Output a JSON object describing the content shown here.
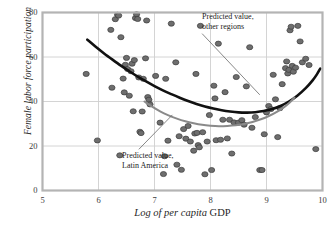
{
  "chart_data": {
    "type": "scatter",
    "title": "",
    "xlabel": "Log of per capita GDP",
    "xlabel_italic_part": "Log of per capita",
    "xlabel_roman_part": "GDP",
    "ylabel": "Female labor force participation",
    "xlim": [
      5,
      10
    ],
    "ylim": [
      0,
      80
    ],
    "xticks": [
      5,
      6,
      7,
      8,
      9,
      10
    ],
    "yticks": [
      0,
      20,
      40,
      60,
      80
    ],
    "grid": true,
    "legend_position": "annotations-inline",
    "colors": {
      "point_fill": "#6e6e6e",
      "point_stroke": "#3c3c3c",
      "curve_other_regions": "#111111",
      "curve_latin_america": "#8a8a8a",
      "grid": "#cfcfcf",
      "frame": "#b4b4b4",
      "text": "#1f1f1f"
    },
    "annotations": [
      {
        "name": "predicted-other-regions",
        "lines": [
          "Predicted value,",
          "other regions"
        ],
        "text_x": 7.85,
        "text_y": 78,
        "leader_from": [
          7.85,
          70.5
        ],
        "leader_to": [
          8.88,
          43.0
        ]
      },
      {
        "name": "predicted-latin-america",
        "lines": [
          "Predicted value,",
          "Latin America"
        ],
        "text_x": 6.42,
        "text_y": 15.5,
        "leader_from": [
          6.72,
          18.5
        ],
        "leader_to": [
          7.32,
          34.0
        ]
      }
    ],
    "series": [
      {
        "name": "Predicted value, other regions",
        "type": "curve",
        "color": "#111111",
        "width": 2.6,
        "points": [
          [
            5.8,
            67.8
          ],
          [
            5.95,
            64.6
          ],
          [
            6.1,
            61.6
          ],
          [
            6.25,
            58.8
          ],
          [
            6.4,
            56.1
          ],
          [
            6.55,
            53.6
          ],
          [
            6.7,
            51.2
          ],
          [
            6.85,
            49.0
          ],
          [
            7.0,
            46.9
          ],
          [
            7.15,
            45.0
          ],
          [
            7.3,
            43.3
          ],
          [
            7.45,
            41.7
          ],
          [
            7.6,
            40.2
          ],
          [
            7.75,
            38.9
          ],
          [
            7.9,
            37.8
          ],
          [
            8.05,
            36.9
          ],
          [
            8.2,
            36.1
          ],
          [
            8.35,
            35.5
          ],
          [
            8.5,
            35.1
          ],
          [
            8.65,
            35.0
          ],
          [
            8.8,
            35.2
          ],
          [
            8.95,
            35.7
          ],
          [
            9.1,
            36.6
          ],
          [
            9.25,
            38.0
          ],
          [
            9.4,
            40.0
          ],
          [
            9.55,
            42.6
          ],
          [
            9.7,
            46.0
          ],
          [
            9.82,
            49.4
          ],
          [
            9.9,
            52.2
          ],
          [
            9.96,
            54.8
          ]
        ]
      },
      {
        "name": "Predicted value, Latin America",
        "type": "curve",
        "color": "#8a8a8a",
        "width": 2.0,
        "points": [
          [
            6.82,
            40.0
          ],
          [
            6.95,
            37.8
          ],
          [
            7.1,
            35.6
          ],
          [
            7.25,
            33.8
          ],
          [
            7.4,
            32.3
          ],
          [
            7.55,
            31.1
          ],
          [
            7.7,
            30.2
          ],
          [
            7.85,
            29.5
          ],
          [
            8.0,
            29.1
          ],
          [
            8.15,
            28.9
          ],
          [
            8.3,
            29.0
          ],
          [
            8.45,
            29.3
          ],
          [
            8.6,
            29.9
          ],
          [
            8.75,
            30.8
          ],
          [
            8.9,
            32.0
          ],
          [
            9.05,
            33.6
          ],
          [
            9.2,
            35.6
          ],
          [
            9.32,
            37.6
          ],
          [
            9.42,
            39.7
          ],
          [
            9.5,
            41.8
          ]
        ]
      },
      {
        "name": "Observations",
        "type": "scatter",
        "marker": "circle",
        "points": [
          [
            5.78,
            52.4
          ],
          [
            5.98,
            22.5
          ],
          [
            6.22,
            72.2
          ],
          [
            6.24,
            46.2
          ],
          [
            6.3,
            77.0
          ],
          [
            6.34,
            79.0
          ],
          [
            6.36,
            78.6
          ],
          [
            6.38,
            15.8
          ],
          [
            6.4,
            68.9
          ],
          [
            6.44,
            50.3
          ],
          [
            6.46,
            44.1
          ],
          [
            6.48,
            56.5
          ],
          [
            6.5,
            59.6
          ],
          [
            6.52,
            54.6
          ],
          [
            6.55,
            42.6
          ],
          [
            6.58,
            53.6
          ],
          [
            6.6,
            57.0
          ],
          [
            6.62,
            35.6
          ],
          [
            6.64,
            58.6
          ],
          [
            6.66,
            77.5
          ],
          [
            6.68,
            79.2
          ],
          [
            6.7,
            77.1
          ],
          [
            6.72,
            50.8
          ],
          [
            6.74,
            26.4
          ],
          [
            6.76,
            25.8
          ],
          [
            6.78,
            35.5
          ],
          [
            6.8,
            50.2
          ],
          [
            6.84,
            59.4
          ],
          [
            6.86,
            76.4
          ],
          [
            6.88,
            42.0
          ],
          [
            6.9,
            40.8
          ],
          [
            6.92,
            38.7
          ],
          [
            7.02,
            51.5
          ],
          [
            7.1,
            30.5
          ],
          [
            7.16,
            7.4
          ],
          [
            7.18,
            15.4
          ],
          [
            7.2,
            50.2
          ],
          [
            7.24,
            22.4
          ],
          [
            7.3,
            75.0
          ],
          [
            7.38,
            57.6
          ],
          [
            7.4,
            11.6
          ],
          [
            7.44,
            24.4
          ],
          [
            7.48,
            9.3
          ],
          [
            7.52,
            27.6
          ],
          [
            7.56,
            23.3
          ],
          [
            7.6,
            29.0
          ],
          [
            7.64,
            22.0
          ],
          [
            7.7,
            17.9
          ],
          [
            7.72,
            25.6
          ],
          [
            7.74,
            52.4
          ],
          [
            7.76,
            25.9
          ],
          [
            7.78,
            20.4
          ],
          [
            7.8,
            19.4
          ],
          [
            7.82,
            74.0
          ],
          [
            7.86,
            26.2
          ],
          [
            7.9,
            7.3
          ],
          [
            7.94,
            22.0
          ],
          [
            7.98,
            33.9
          ],
          [
            8.02,
            9.2
          ],
          [
            8.06,
            47.1
          ],
          [
            8.08,
            41.4
          ],
          [
            8.1,
            22.6
          ],
          [
            8.14,
            66.0
          ],
          [
            8.18,
            22.8
          ],
          [
            8.22,
            31.8
          ],
          [
            8.26,
            44.2
          ],
          [
            8.3,
            23.4
          ],
          [
            8.34,
            31.8
          ],
          [
            8.38,
            16.6
          ],
          [
            8.42,
            30.6
          ],
          [
            8.46,
            51.0
          ],
          [
            8.5,
            30.5
          ],
          [
            8.56,
            31.6
          ],
          [
            8.6,
            29.6
          ],
          [
            8.64,
            46.8
          ],
          [
            8.7,
            64.4
          ],
          [
            8.74,
            28.2
          ],
          [
            8.8,
            33.0
          ],
          [
            8.88,
            9.2
          ],
          [
            8.92,
            9.2
          ],
          [
            8.96,
            25.3
          ],
          [
            9.0,
            35.1
          ],
          [
            9.04,
            38.0
          ],
          [
            9.08,
            36.6
          ],
          [
            9.12,
            52.0
          ],
          [
            9.16,
            41.0
          ],
          [
            9.2,
            24.0
          ],
          [
            9.24,
            37.0
          ],
          [
            9.28,
            47.8
          ],
          [
            9.34,
            55.0
          ],
          [
            9.36,
            58.0
          ],
          [
            9.38,
            52.6
          ],
          [
            9.4,
            54.2
          ],
          [
            9.42,
            72.0
          ],
          [
            9.44,
            73.6
          ],
          [
            9.46,
            56.0
          ],
          [
            9.48,
            53.4
          ],
          [
            9.52,
            55.2
          ],
          [
            9.56,
            74.0
          ],
          [
            9.6,
            67.0
          ],
          [
            9.64,
            57.6
          ],
          [
            9.7,
            59.2
          ],
          [
            9.76,
            56.4
          ],
          [
            9.88,
            18.6
          ]
        ]
      }
    ]
  },
  "axis": {
    "xticklabels": [
      "5",
      "6",
      "7",
      "8",
      "9",
      "10"
    ],
    "yticklabels": [
      "0",
      "20",
      "40",
      "60",
      "80"
    ]
  }
}
